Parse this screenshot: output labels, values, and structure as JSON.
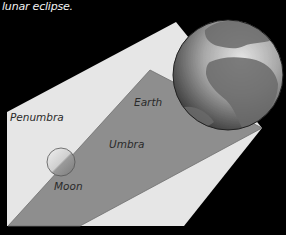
{
  "caption": "lunar eclipse.",
  "labels": {
    "earth": "Earth",
    "penumbra": "Penumbra",
    "umbra": "Umbra",
    "moon": "Moon"
  },
  "colors": {
    "background": "#000000",
    "penumbra": "#e6e6e6",
    "umbra": "#8c8c8c",
    "earth_light": "#d8d8d8",
    "earth_dark": "#3a3a3a",
    "moon_light": "#e8e8e8",
    "moon_dark": "#8a8a8a"
  }
}
